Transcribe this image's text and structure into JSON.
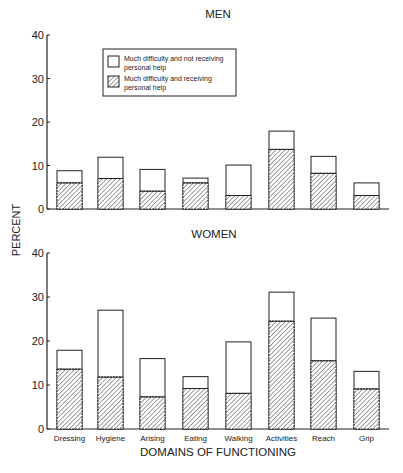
{
  "chart_data": [
    {
      "type": "bar",
      "stacked": true,
      "title": "MEN",
      "xlabel": "",
      "ylabel": "PERCENT",
      "ylim": [
        0,
        40
      ],
      "yticks": [
        0,
        10,
        20,
        30,
        40
      ],
      "grid": false,
      "legend_position": "upper-left inside",
      "categories": [
        "Dressing",
        "Hygiene",
        "Arising",
        "Eating",
        "Walking",
        "Activities",
        "Reach",
        "Grip"
      ],
      "series": [
        {
          "name": "Much difficulty and receiving personal help",
          "pattern": "hatched",
          "values": [
            6.0,
            7.0,
            4.1,
            6.0,
            3.1,
            13.7,
            8.2,
            3.1
          ]
        },
        {
          "name": "Much difficulty and not receiving personal help",
          "pattern": "open",
          "values": [
            2.8,
            4.9,
            5.0,
            1.1,
            7.0,
            4.2,
            3.9,
            2.9
          ]
        }
      ],
      "totals": [
        8.8,
        11.9,
        9.1,
        7.1,
        10.1,
        17.9,
        12.1,
        6.0
      ]
    },
    {
      "type": "bar",
      "stacked": true,
      "title": "WOMEN",
      "xlabel": "DOMAINS OF FUNCTIONING",
      "ylabel": "PERCENT",
      "ylim": [
        0,
        40
      ],
      "yticks": [
        0,
        10,
        20,
        30,
        40
      ],
      "grid": false,
      "categories": [
        "Dressing",
        "Hygiene",
        "Arising",
        "Eating",
        "Walking",
        "Activities",
        "Reach",
        "Grip"
      ],
      "series": [
        {
          "name": "Much difficulty and receiving personal help",
          "pattern": "hatched",
          "values": [
            13.6,
            11.8,
            7.3,
            9.2,
            8.1,
            24.5,
            15.5,
            9.1
          ]
        },
        {
          "name": "Much difficulty and not receiving personal help",
          "pattern": "open",
          "values": [
            4.3,
            15.2,
            8.7,
            2.7,
            11.7,
            6.6,
            9.7,
            4.0
          ]
        }
      ],
      "totals": [
        17.9,
        27.0,
        16.0,
        11.9,
        19.8,
        31.1,
        25.2,
        13.1
      ]
    }
  ],
  "legend": {
    "items": [
      {
        "label_line1": "Much difficulty and not receiving",
        "label_line2": "personal help",
        "pattern": "open"
      },
      {
        "label_line1": "Much difficulty and receiving",
        "label_line2": "personal help",
        "pattern": "hatched"
      }
    ]
  },
  "labels": {
    "men_title": "MEN",
    "women_title": "WOMEN",
    "ylabel": "PERCENT",
    "xlabel": "DOMAINS OF FUNCTIONING"
  }
}
